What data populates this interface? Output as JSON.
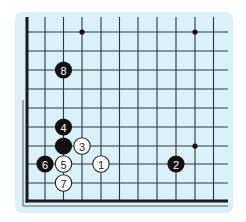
{
  "diagram": {
    "type": "go-board-diagram",
    "colors": {
      "page_background": "#ffffff",
      "board_background": "#d9f1f7",
      "grid_line": "#2b3a3e",
      "edge_line": "#1a1a1a",
      "black_stone": "#111111",
      "white_stone": "#ffffff",
      "black_label": "#ffffff",
      "white_label": "#222222"
    },
    "grid": {
      "columns": 11,
      "rows": 10,
      "x_positions": [
        27,
        45,
        63.5,
        82,
        101,
        119.5,
        138,
        157,
        176,
        195,
        213.5
      ],
      "y_positions": [
        32,
        51,
        70,
        89,
        108,
        127,
        146,
        164,
        183,
        201
      ],
      "left_edge_thick": true,
      "bottom_edge_thick": true,
      "open_top": true,
      "open_right": true
    },
    "star_points": [
      {
        "col": 3,
        "row": 0
      },
      {
        "col": 9,
        "row": 0
      },
      {
        "col": 9,
        "row": 6
      }
    ],
    "stones": [
      {
        "color": "white",
        "label": "1",
        "col": 4,
        "row": 7
      },
      {
        "color": "black",
        "label": "2",
        "col": 8,
        "row": 7
      },
      {
        "color": "white",
        "label": "3",
        "col": 3,
        "row": 6
      },
      {
        "color": "black",
        "label": "4",
        "col": 2,
        "row": 5
      },
      {
        "color": "white",
        "label": "5",
        "col": 2,
        "row": 7
      },
      {
        "color": "black",
        "label": "6",
        "col": 1,
        "row": 7
      },
      {
        "color": "white",
        "label": "7",
        "col": 2,
        "row": 8
      },
      {
        "color": "black",
        "label": "8",
        "col": 2,
        "row": 2
      },
      {
        "color": "black",
        "label": "",
        "col": 2,
        "row": 6
      }
    ]
  }
}
